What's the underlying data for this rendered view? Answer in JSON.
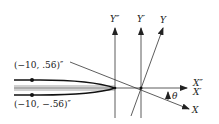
{
  "diagram": {
    "points": {
      "upper": "(−10, .56)″",
      "lower": "(−10, −.56)″"
    },
    "axes": {
      "y_double_prime": "Y″",
      "y_prime": "Y′",
      "y": "Y",
      "x_double_prime": "X″",
      "x_prime": "X′",
      "x": "X"
    },
    "angle": "θ",
    "colors": {
      "line": "#222222",
      "thin_line": "#555555",
      "background": "#ffffff"
    }
  }
}
